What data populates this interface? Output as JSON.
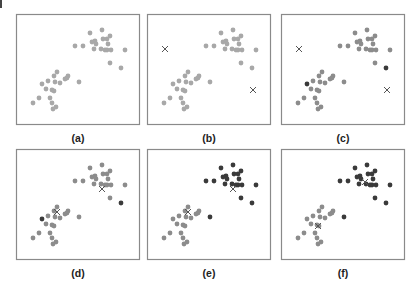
{
  "figure": {
    "type": "k-means clustering illustration",
    "colors": {
      "frame": "#8a8a8a",
      "unassigned": "#a8a8a8",
      "cluster_light": "#8c8c8c",
      "cluster_dark": "#3a3a3a",
      "centroid": "#555555"
    },
    "frame_size": [
      124,
      111
    ],
    "points": [
      [
        74,
        19
      ],
      [
        86,
        16
      ],
      [
        94,
        22
      ],
      [
        87,
        25
      ],
      [
        91,
        25
      ],
      [
        79,
        27
      ],
      [
        76,
        28
      ],
      [
        80,
        30
      ],
      [
        92,
        30
      ],
      [
        91,
        36
      ],
      [
        85,
        35
      ],
      [
        89,
        36
      ],
      [
        95,
        36
      ],
      [
        59,
        32
      ],
      [
        67,
        32
      ],
      [
        78,
        35
      ],
      [
        109,
        36
      ],
      [
        94,
        49
      ],
      [
        105,
        54
      ],
      [
        26,
        70
      ],
      [
        32,
        67
      ],
      [
        38,
        62
      ],
      [
        30,
        75
      ],
      [
        41,
        58
      ],
      [
        52,
        62
      ],
      [
        49,
        65
      ],
      [
        51,
        64
      ],
      [
        44,
        69
      ],
      [
        39,
        68
      ],
      [
        63,
        68
      ],
      [
        36,
        76
      ],
      [
        38,
        77
      ],
      [
        23,
        84
      ],
      [
        17,
        89
      ],
      [
        36,
        89
      ],
      [
        40,
        93
      ],
      [
        37,
        95
      ],
      [
        34,
        84
      ]
    ],
    "panels": [
      {
        "id": "a",
        "label": "(a)",
        "stage": "unlabeled data",
        "assign": "none",
        "centroids": []
      },
      {
        "id": "b",
        "label": "(b)",
        "stage": "initial centroids",
        "assign": "none",
        "centroids": [
          [
            18,
            35
          ],
          [
            106,
            76
          ]
        ]
      },
      {
        "id": "c",
        "label": "(c)",
        "stage": "first assignment",
        "assign": "c",
        "centroids": [
          [
            18,
            35
          ],
          [
            106,
            76
          ]
        ]
      },
      {
        "id": "d",
        "label": "(d)",
        "stage": "updated centroids",
        "assign": "c",
        "centroids": [
          [
            41,
            63
          ],
          [
            86,
            40
          ]
        ]
      },
      {
        "id": "e",
        "label": "(e)",
        "stage": "second assignment",
        "assign": "e",
        "centroids": [
          [
            41,
            63
          ],
          [
            86,
            40
          ]
        ]
      },
      {
        "id": "f",
        "label": "(f)",
        "stage": "converged centroids",
        "assign": "e",
        "centroids": [
          [
            37,
            77
          ],
          [
            84,
            33
          ]
        ]
      }
    ],
    "assignments": {
      "c": "LLLLLLLLLLLLLLLLLLDDLLLLLLLLLLLLLLLLLL",
      "e": "DDDDDDDDDDDDDDDDDDDLLLLLLLLLLDLLLLLLLL"
    }
  }
}
